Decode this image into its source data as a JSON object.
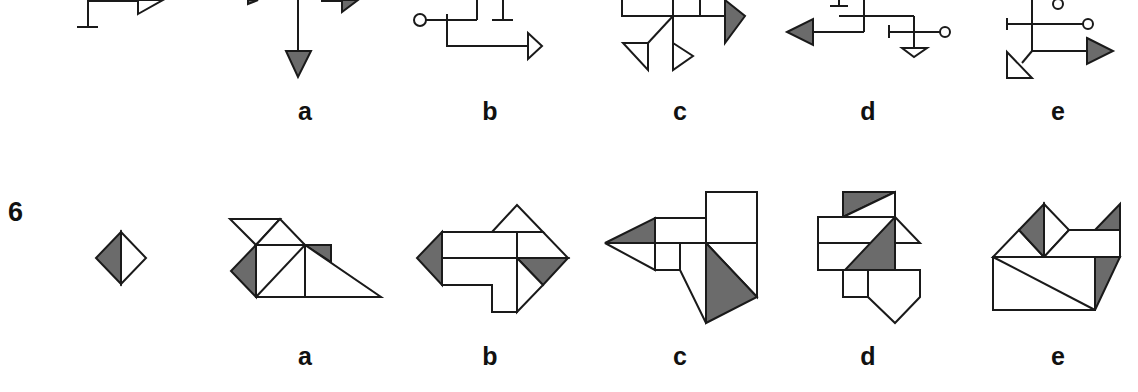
{
  "colors": {
    "stroke": "#1a1a1a",
    "shade": "#6b6b6b",
    "fill": "#ffffff"
  },
  "row1": {
    "options": [
      {
        "label": "a",
        "x": 305
      },
      {
        "label": "b",
        "x": 490
      },
      {
        "label": "c",
        "x": 680
      },
      {
        "label": "d",
        "x": 868
      },
      {
        "label": "e",
        "x": 1058
      }
    ]
  },
  "question6": {
    "number": "6",
    "prompt_shape": "diamond split vertically, left half shaded",
    "options": [
      {
        "label": "a",
        "x": 305
      },
      {
        "label": "b",
        "x": 490
      },
      {
        "label": "c",
        "x": 680
      },
      {
        "label": "d",
        "x": 868
      },
      {
        "label": "e",
        "x": 1058
      }
    ]
  }
}
